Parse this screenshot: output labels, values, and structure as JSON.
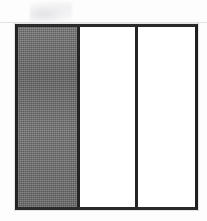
{
  "figure": {
    "background_color": "#fdfdfd",
    "border_color": "#242424",
    "border_width_px": 3,
    "frame": {
      "x": 15,
      "y": 24,
      "width": 183,
      "height": 186
    },
    "panels": [
      {
        "name": "left-panel",
        "fill": "shaded",
        "fill_color": "#6e6e6e",
        "width_px": 62,
        "label": ""
      },
      {
        "name": "middle-panel",
        "fill": "blank",
        "fill_color": "#ffffff",
        "width_px": 58,
        "label": ""
      },
      {
        "name": "right-panel",
        "fill": "blank",
        "fill_color": "#ffffff",
        "width_px": 55,
        "label": ""
      }
    ],
    "dividers": [
      {
        "name": "divider-1",
        "x": 77,
        "color": "#232323",
        "width_px": 3
      },
      {
        "name": "divider-2",
        "x": 138,
        "color": "#242424",
        "width_px": 3
      }
    ],
    "artifacts": [
      {
        "name": "scan-smudge",
        "kind": "light-gray-smudge",
        "x": 30,
        "y": 2,
        "width": 42,
        "height": 20,
        "color": "#e6e6e9"
      },
      {
        "name": "scan-line-top",
        "kind": "horizontal-scan-line",
        "x": 0,
        "y": 22,
        "width": 207,
        "height": 1,
        "color": "#dedee0"
      }
    ]
  }
}
